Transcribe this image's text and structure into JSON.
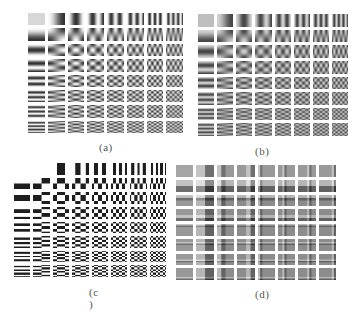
{
  "figure": {
    "panels": [
      {
        "id": "a",
        "label": "(a)",
        "kind": "dct",
        "rows": 8,
        "cols": 8,
        "contrast": "soft",
        "blank_cells": []
      },
      {
        "id": "b",
        "label": "(b)",
        "kind": "dct",
        "rows": 8,
        "cols": 8,
        "contrast": "muted",
        "blank_cells": []
      },
      {
        "id": "c",
        "label": "(c )",
        "kind": "walsh-hadamard",
        "rows": 8,
        "cols": 8,
        "contrast": "binary",
        "blank_cells": [
          [
            0,
            0
          ],
          [
            0,
            1
          ]
        ]
      },
      {
        "id": "d",
        "label": "(d)",
        "kind": "haar-like",
        "rows": 8,
        "cols": 8,
        "contrast": "gray",
        "blank_cells": []
      }
    ]
  },
  "colors": {
    "background": "#ffffff",
    "label": "#555555",
    "cell_gray": "#8c8c8c"
  }
}
